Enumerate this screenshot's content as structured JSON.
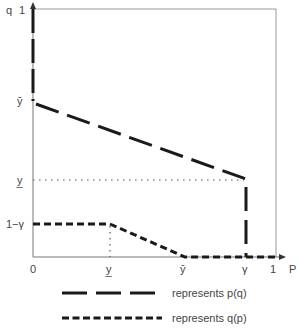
{
  "diagram": {
    "y_axis": {
      "name": "q",
      "top_label": "1",
      "ticks": [
        {
          "label": "ȳ",
          "y": 101
        },
        {
          "label": "y̲",
          "y": 180
        },
        {
          "label": "1−γ",
          "y": 224
        }
      ]
    },
    "x_axis": {
      "name": "P",
      "ticks": [
        {
          "label": "0",
          "x": 33
        },
        {
          "label": "y̲",
          "x": 109
        },
        {
          "label": "ȳ",
          "x": 183
        },
        {
          "label": "γ",
          "x": 245
        },
        {
          "label": "1",
          "x": 273
        }
      ]
    },
    "curves": {
      "p_of_q": {
        "style": "long-dash",
        "points": [
          [
            33,
            9
          ],
          [
            33,
            101
          ],
          [
            246,
            179
          ],
          [
            246,
            257
          ]
        ]
      },
      "q_of_p": {
        "style": "short-dash",
        "points": [
          [
            33,
            224
          ],
          [
            110,
            224
          ],
          [
            185,
            257
          ],
          [
            276,
            257
          ]
        ]
      },
      "guides": [
        {
          "from": [
            33,
            180
          ],
          "to": [
            246,
            180
          ],
          "style": "dotted"
        },
        {
          "from": [
            110,
            224
          ],
          "to": [
            110,
            257
          ],
          "style": "dotted"
        }
      ]
    },
    "legend": [
      {
        "style": "long-dash",
        "text": "represents p(q)"
      },
      {
        "style": "short-dash",
        "text": "represents q(p)"
      }
    ]
  }
}
